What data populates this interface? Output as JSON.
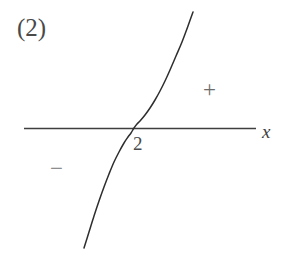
{
  "figure": {
    "panel_label": "(2)",
    "background_color": "#ffffff",
    "ink_color": "#3a3a3a",
    "width": 286,
    "height": 267
  },
  "annotations": {
    "root_label": "2",
    "sign_positive": "+",
    "sign_negative": "−"
  },
  "chart_data": {
    "type": "line",
    "title": "(2)",
    "xlabel": "x",
    "ylabel": "",
    "grid": false,
    "legend": null,
    "axes": {
      "x_axis_drawn": true,
      "y_axis_drawn": false,
      "x_axis_pixel_y": 128,
      "x_axis_pixel_start": 24,
      "x_axis_pixel_end": 256,
      "x_tick_labels": [
        "2"
      ],
      "x_tick_values": [
        2
      ],
      "y_tick_labels": []
    },
    "series": [
      {
        "name": "y = (x - 2)^3",
        "description": "Odd cubic with a triple root at x = 2; flat (horizontal) tangent at the crossing, negative to the left, positive to the right.",
        "root": 2,
        "multiplicity": 3,
        "sign_left_of_root": "negative",
        "sign_right_of_root": "positive",
        "points_pixel": [
          [
            84,
            248
          ],
          [
            89,
            232
          ],
          [
            94,
            216
          ],
          [
            99,
            201
          ],
          [
            104,
            187
          ],
          [
            109,
            174
          ],
          [
            114,
            162
          ],
          [
            119,
            152
          ],
          [
            124,
            143
          ],
          [
            128,
            137
          ],
          [
            131,
            133
          ],
          [
            134,
            128
          ],
          [
            137,
            124
          ],
          [
            140,
            121
          ],
          [
            145,
            115
          ],
          [
            150,
            108
          ],
          [
            155,
            100
          ],
          [
            160,
            91
          ],
          [
            165,
            81
          ],
          [
            170,
            70
          ],
          [
            176,
            56
          ],
          [
            182,
            42
          ],
          [
            188,
            26
          ],
          [
            193,
            12
          ]
        ]
      }
    ],
    "annotations": [
      {
        "text": "2",
        "meaning": "x-intercept tick label",
        "pixel": [
          139,
          147
        ]
      },
      {
        "text": "+",
        "meaning": "curve is positive (above axis) for x > 2",
        "pixel": [
          211,
          90
        ]
      },
      {
        "text": "−",
        "meaning": "curve is negative (below axis) for x < 2",
        "pixel": [
          58,
          169
        ]
      },
      {
        "text": "x",
        "meaning": "horizontal axis label",
        "pixel": [
          268,
          132
        ]
      },
      {
        "text": "(2)",
        "meaning": "problem / part number",
        "pixel": [
          33,
          28
        ]
      }
    ]
  }
}
